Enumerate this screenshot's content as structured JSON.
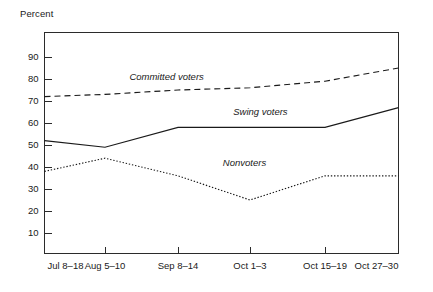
{
  "chart_data": {
    "type": "line",
    "title": "",
    "xlabel": "",
    "ylabel": "Percent",
    "ylim": [
      0,
      100
    ],
    "yticks": [
      10,
      20,
      30,
      40,
      50,
      60,
      70,
      80,
      90
    ],
    "grid": false,
    "legend_position": "inline-annotations",
    "categories": [
      "Jul 8–18",
      "Aug 5–10",
      "Sep 8–14",
      "Oct 1–3",
      "Oct 15–19",
      "Oct 27–30"
    ],
    "series": [
      {
        "name": "Committed voters",
        "style": "dashed",
        "values": [
          72,
          73,
          75,
          76,
          79,
          85
        ]
      },
      {
        "name": "Swing voters",
        "style": "solid",
        "values": [
          52,
          49,
          58,
          58,
          58,
          67
        ]
      },
      {
        "name": "Nonvoters",
        "style": "dotted",
        "values": [
          38,
          44,
          36,
          25,
          36,
          36
        ]
      }
    ],
    "annotations": [
      {
        "text": "Committed voters",
        "x_frac": 0.345,
        "value": 79.5
      },
      {
        "text": "Swing voters",
        "x_frac": 0.61,
        "value": 63.5
      },
      {
        "text": "Nonvoters",
        "x_frac": 0.565,
        "value": 40.5
      }
    ]
  },
  "labels": {
    "y_axis_title": "Percent",
    "y_ticks": [
      "90",
      "80",
      "70",
      "60",
      "50",
      "40",
      "30",
      "20",
      "10"
    ],
    "x_ticks": [
      "Jul 8–18",
      "Aug 5–10",
      "Sep 8–14",
      "Oct 1–3",
      "Oct 15–19",
      "Oct 27–30"
    ],
    "series_names": [
      "Committed voters",
      "Swing voters",
      "Nonvoters"
    ]
  },
  "colors": {
    "line": "#1a1a1a",
    "frame": "#2b2b2b",
    "background": "#ffffff",
    "text": "#1a1a1a"
  }
}
